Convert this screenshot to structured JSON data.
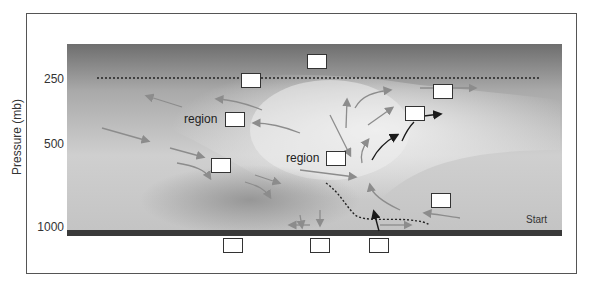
{
  "diagram": {
    "y_axis": {
      "label": "Pressure (mb)",
      "ticks": [
        "250",
        "500",
        "1000"
      ]
    },
    "labels": {
      "region_upper": "region",
      "region_middle": "region",
      "start": "Start"
    },
    "answer_boxes": [
      {
        "id": "top-center",
        "value": ""
      },
      {
        "id": "tropopause-left",
        "value": ""
      },
      {
        "id": "upper-right",
        "value": ""
      },
      {
        "id": "region-upper",
        "value": ""
      },
      {
        "id": "mid-right-outflow",
        "value": ""
      },
      {
        "id": "region-middle",
        "value": ""
      },
      {
        "id": "left-mid-descent",
        "value": ""
      },
      {
        "id": "lower-right",
        "value": ""
      },
      {
        "id": "below-surface-left",
        "value": ""
      },
      {
        "id": "below-surface-center",
        "value": ""
      },
      {
        "id": "below-surface-right",
        "value": ""
      }
    ],
    "colors": {
      "sky_top": "#7a7a7a",
      "sky_light": "#d8d8d8",
      "surface": "#3a3a3a",
      "arrow_gray": "#8c8c8c",
      "arrow_dark": "#1a1a1a"
    }
  }
}
